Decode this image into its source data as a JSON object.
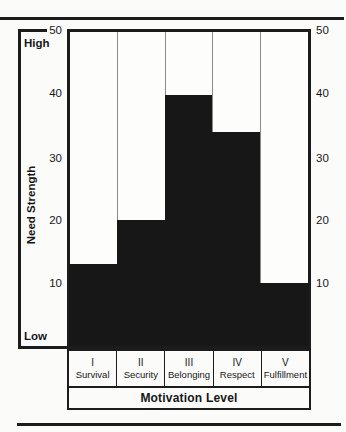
{
  "figure": {
    "background": "#fbfbfa",
    "ink": "#1c1c1c",
    "column_separator_color": "#8a8a8a"
  },
  "chart_data": {
    "type": "bar",
    "title": "",
    "categories": [
      {
        "numeral": "I",
        "label": "Survival"
      },
      {
        "numeral": "II",
        "label": "Security"
      },
      {
        "numeral": "III",
        "label": "Belonging"
      },
      {
        "numeral": "IV",
        "label": "Respect"
      },
      {
        "numeral": "V",
        "label": "Fulfillment"
      }
    ],
    "values": [
      13,
      20,
      40,
      34,
      10
    ],
    "xlabel": "Motivation Level",
    "ylabel": "Need Strength",
    "ylim": [
      0,
      50
    ],
    "yticks": [
      50,
      40,
      30,
      20,
      10
    ],
    "axis_end_labels": {
      "top": "High",
      "bottom": "Low"
    },
    "bar_color": "#171717",
    "grid": false,
    "legend": "none",
    "column_separators": true
  }
}
